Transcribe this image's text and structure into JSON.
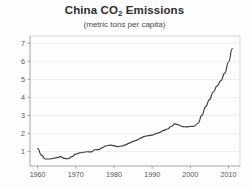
{
  "chart_data": {
    "type": "line",
    "title": "China CO2 Emissions",
    "title_main": "China CO",
    "title_sub": "2",
    "title_tail": " Emissions",
    "subtitle": "(metric tons per capita)",
    "xlabel": "",
    "ylabel": "",
    "xlim": [
      1958,
      2013
    ],
    "ylim": [
      0.2,
      7.4
    ],
    "grid": true,
    "legend": "none",
    "xticks": [
      1960,
      1970,
      1980,
      1990,
      2000,
      2010
    ],
    "xtick_labels": [
      "1960",
      "1970",
      "1980",
      "1990",
      "2000",
      "2010"
    ],
    "yticks": [
      1,
      2,
      3,
      4,
      5,
      6,
      7
    ],
    "ytick_labels": [
      "1",
      "2",
      "3",
      "4",
      "5",
      "6",
      "7"
    ],
    "line_color": "#3c3c3c",
    "grid_color": "#e9e9e9",
    "axis_color": "#8d8d8d",
    "x": [
      1960,
      1961,
      1962,
      1963,
      1964,
      1965,
      1966,
      1967,
      1968,
      1969,
      1970,
      1971,
      1972,
      1973,
      1974,
      1975,
      1976,
      1977,
      1978,
      1979,
      1980,
      1981,
      1982,
      1983,
      1984,
      1985,
      1986,
      1987,
      1988,
      1989,
      1990,
      1991,
      1992,
      1993,
      1994,
      1995,
      1996,
      1997,
      1998,
      1999,
      2000,
      2001,
      2002,
      2003,
      2004,
      2005,
      2006,
      2007,
      2008,
      2009,
      2010,
      2011
    ],
    "values": [
      1.17,
      0.8,
      0.59,
      0.59,
      0.62,
      0.66,
      0.72,
      0.62,
      0.6,
      0.72,
      0.86,
      0.93,
      0.96,
      0.99,
      0.98,
      1.1,
      1.11,
      1.22,
      1.32,
      1.36,
      1.33,
      1.27,
      1.31,
      1.37,
      1.47,
      1.56,
      1.63,
      1.74,
      1.84,
      1.88,
      1.91,
      1.99,
      2.06,
      2.17,
      2.25,
      2.4,
      2.53,
      2.47,
      2.38,
      2.37,
      2.39,
      2.4,
      2.57,
      3.0,
      3.49,
      3.88,
      4.3,
      4.64,
      4.93,
      5.34,
      5.96,
      6.71
    ]
  }
}
